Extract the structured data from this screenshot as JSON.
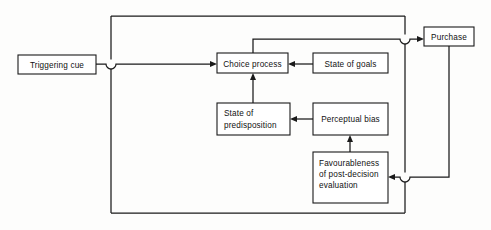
{
  "diagram": {
    "type": "flowchart",
    "stroke_color": "#1a1a1a",
    "box_fill": "#ffffff",
    "background": "#fdfdfc",
    "nodes": [
      {
        "id": "triggering-cue",
        "label": "Triggering cue",
        "lines": [
          "Triggering cue"
        ],
        "x": 18,
        "y": 55,
        "w": 78,
        "h": 19,
        "align": "center"
      },
      {
        "id": "choice-process",
        "label": "Choice process",
        "lines": [
          "Choice process"
        ],
        "x": 217,
        "y": 53,
        "w": 71,
        "h": 20,
        "align": "center"
      },
      {
        "id": "state-of-goals",
        "label": "State of goals",
        "lines": [
          "State of goals"
        ],
        "x": 313,
        "y": 53,
        "w": 75,
        "h": 20,
        "align": "center"
      },
      {
        "id": "state-of-predisposition",
        "label": "State of predisposition",
        "lines": [
          "State of",
          "predisposition"
        ],
        "x": 217,
        "y": 103,
        "w": 73,
        "h": 32,
        "align": "left"
      },
      {
        "id": "perceptual-bias",
        "label": "Perceptual bias",
        "lines": [
          "Perceptual bias"
        ],
        "x": 313,
        "y": 103,
        "w": 75,
        "h": 32,
        "align": "center"
      },
      {
        "id": "favourableness-of-post-decision-evaluation",
        "label": "Favourableness of post-decision evaluation",
        "lines": [
          "Favourableness",
          "of post-decision",
          "evaluation"
        ],
        "x": 313,
        "y": 152,
        "w": 75,
        "h": 51,
        "align": "left"
      },
      {
        "id": "purchase",
        "label": "Purchase",
        "lines": [
          "Purchase"
        ],
        "x": 424,
        "y": 27,
        "w": 50,
        "h": 19,
        "align": "center"
      }
    ],
    "connections": [
      {
        "id": "cue-to-choice",
        "from": "triggering-cue",
        "to": "choice-process",
        "arrow": true
      },
      {
        "id": "goals-to-choice",
        "from": "state-of-goals",
        "to": "choice-process",
        "arrow": true
      },
      {
        "id": "predisposition-to-choice",
        "from": "state-of-predisposition",
        "to": "choice-process",
        "arrow": true
      },
      {
        "id": "perceptual-bias-to-predisposition",
        "from": "perceptual-bias",
        "to": "state-of-predisposition",
        "arrow": true
      },
      {
        "id": "favourableness-to-perceptual-bias",
        "from": "favourableness-of-post-decision-evaluation",
        "to": "perceptual-bias",
        "arrow": true
      },
      {
        "id": "choice-to-purchase",
        "from": "choice-process",
        "to": "purchase",
        "arrow": true
      },
      {
        "id": "purchase-to-favourableness",
        "from": "purchase",
        "to": "favourableness-of-post-decision-evaluation",
        "arrow": true
      },
      {
        "id": "feedback-loop-outer",
        "from": "favourableness-of-post-decision-evaluation",
        "to": "choice-process",
        "arrow": false
      }
    ],
    "line_hops": [
      {
        "id": "hop-triggering-cue",
        "x": 111,
        "y": 64
      },
      {
        "id": "hop-purchase-input",
        "x": 405,
        "y": 39
      },
      {
        "id": "hop-purchase-output",
        "x": 405,
        "y": 177
      }
    ]
  }
}
